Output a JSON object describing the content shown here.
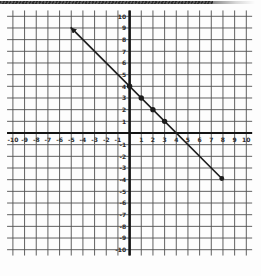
{
  "page": {
    "background": "#fdfdfd",
    "scan_artifact": {
      "description": "dark hatched strip along top edge of scanned page",
      "color": "#3a3a3a",
      "fade_color": "#9a9a9a"
    }
  },
  "chart_data": {
    "type": "line",
    "title": "",
    "grid": true,
    "legend": false,
    "xlabel": "",
    "ylabel": "",
    "xlim": [
      -10,
      10
    ],
    "ylim": [
      -10,
      10
    ],
    "x_tick_labels": [
      "-10",
      "-9",
      "-8",
      "-7",
      "-6",
      "-5",
      "-4",
      "-3",
      "-2",
      "-1",
      "1",
      "2",
      "3",
      "4",
      "5",
      "6",
      "7",
      "8",
      "9",
      "10"
    ],
    "y_tick_labels": [
      "10",
      "9",
      "8",
      "7",
      "6",
      "5",
      "4",
      "3",
      "2",
      "1",
      "-1",
      "-2",
      "-3",
      "-4",
      "-5",
      "-6",
      "-7",
      "-8",
      "-9",
      "-10"
    ],
    "line": {
      "equation": "y = -x + 4",
      "slope": -1,
      "y_intercept": 4,
      "x_intercept": 4,
      "segment_start": [
        -5.05,
        9.05
      ],
      "segment_end": [
        7.9,
        -3.9
      ],
      "start_cap": "arrow",
      "end_cap": "dot",
      "color": "#1c1c1c"
    },
    "marked_points": [
      [
        0,
        4
      ],
      [
        1,
        3
      ],
      [
        2,
        2
      ],
      [
        3,
        1
      ]
    ],
    "colors": {
      "grid": "#4f4f4f",
      "axis": "#141414",
      "label": "#2b2b2b"
    }
  }
}
